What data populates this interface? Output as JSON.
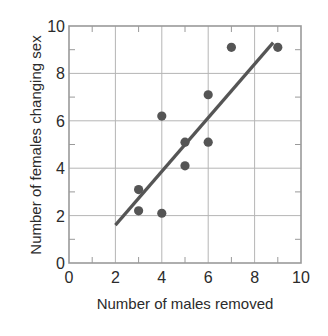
{
  "chart_data": {
    "type": "scatter",
    "title": "",
    "xlabel": "Number of males removed",
    "ylabel": "Number of females changing sex",
    "xlim": [
      0,
      10
    ],
    "ylim": [
      0,
      10
    ],
    "x_ticks": [
      0,
      2,
      4,
      6,
      8,
      10
    ],
    "y_ticks": [
      0,
      2,
      4,
      6,
      8,
      10
    ],
    "x_tick_labels": [
      "0",
      "2",
      "4",
      "6",
      "8",
      "10"
    ],
    "y_tick_labels": [
      "0",
      "2",
      "4",
      "6",
      "8",
      "10"
    ],
    "minor_ticks": [
      1,
      3,
      5,
      7,
      9
    ],
    "grid": true,
    "legend": null,
    "series": [
      {
        "name": "observations",
        "type": "scatter",
        "color": "#555555",
        "points": [
          {
            "x": 3,
            "y": 3.1
          },
          {
            "x": 3,
            "y": 2.2
          },
          {
            "x": 4,
            "y": 2.1
          },
          {
            "x": 4,
            "y": 6.2
          },
          {
            "x": 5,
            "y": 5.1
          },
          {
            "x": 5,
            "y": 4.1
          },
          {
            "x": 6,
            "y": 5.1
          },
          {
            "x": 6,
            "y": 7.1
          },
          {
            "x": 7,
            "y": 9.1
          },
          {
            "x": 9,
            "y": 9.1
          }
        ]
      },
      {
        "name": "regression line",
        "type": "line",
        "color": "#555555",
        "points": [
          {
            "x": 2,
            "y": 1.6
          },
          {
            "x": 8.8,
            "y": 9.3
          }
        ]
      }
    ]
  },
  "colors": {
    "axis": "#9a9a9a",
    "grid": "#b5b5b5",
    "marker": "#555555",
    "line": "#555555",
    "text": "#2b2b2b"
  }
}
